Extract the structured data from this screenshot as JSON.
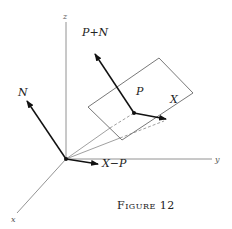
{
  "figure": {
    "caption": "Figure 12",
    "axes": {
      "x": "x",
      "y": "y",
      "z": "z"
    },
    "vectors": {
      "normal": "N",
      "p_plus_n": "P+N",
      "point": "P",
      "x_point": "X",
      "x_minus_p": "X−P"
    }
  }
}
